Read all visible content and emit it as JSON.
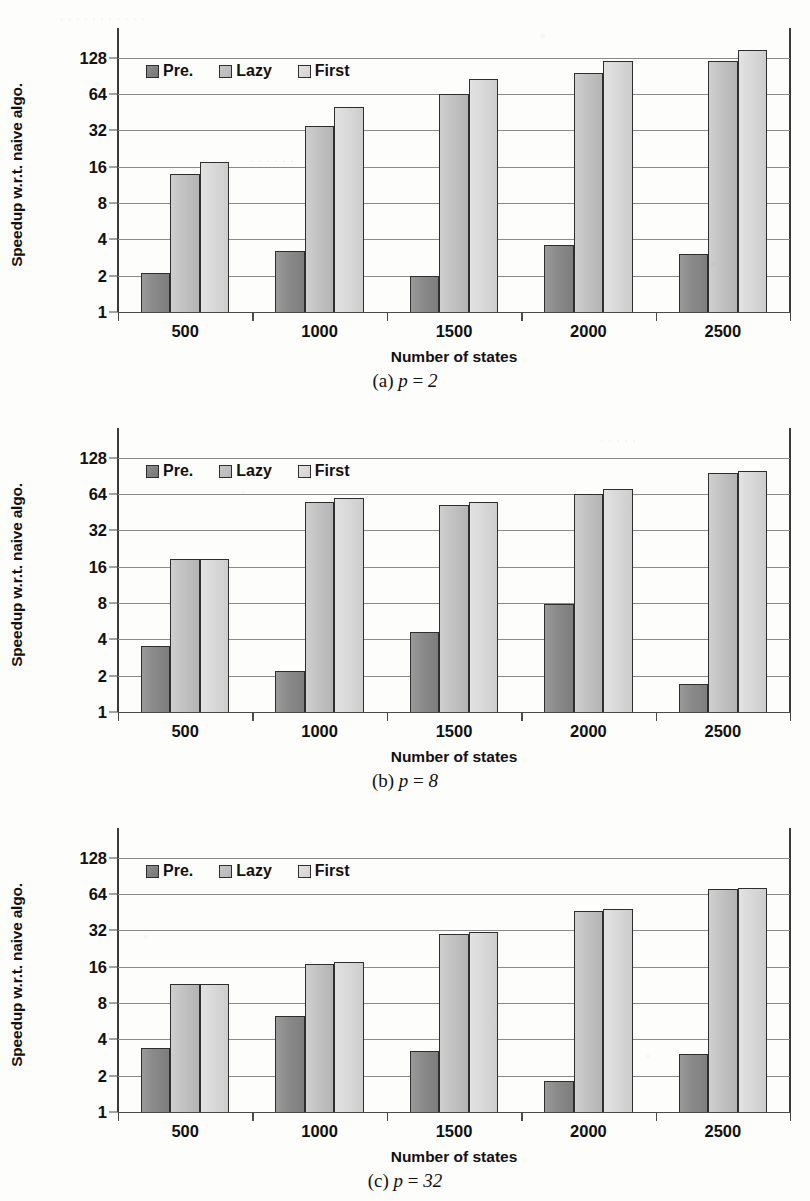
{
  "figure": {
    "axis": {
      "ylabel": "Speedup w.r.t. naive algo.",
      "xlabel": "Number of states",
      "yticks": [
        "1",
        "2",
        "4",
        "8",
        "16",
        "32",
        "64",
        "128"
      ],
      "xticklabels": [
        "500",
        "1000",
        "1500",
        "2000",
        "2500"
      ]
    },
    "legend": {
      "items": [
        {
          "label": "Pre.",
          "swatch": "dark-gray-square-icon",
          "color": "#8b8b8b"
        },
        {
          "label": "Lazy",
          "swatch": "medium-gray-square-icon",
          "color": "#c2c2c2"
        },
        {
          "label": "First",
          "swatch": "light-gray-square-icon",
          "color": "#d9d9d9"
        }
      ]
    },
    "panels": [
      {
        "id": "panel-a",
        "caption_index": "(a)",
        "caption_var": "p",
        "caption_eq": "=",
        "caption_value": "2"
      },
      {
        "id": "panel-b",
        "caption_index": "(b)",
        "caption_var": "p",
        "caption_eq": "=",
        "caption_value": "8"
      },
      {
        "id": "panel-c",
        "caption_index": "(c)",
        "caption_var": "p",
        "caption_eq": "=",
        "caption_value": "32"
      }
    ]
  },
  "chart_data": [
    {
      "type": "bar",
      "title": "(a) p = 2",
      "xlabel": "Number of states",
      "ylabel": "Speedup w.r.t. naive algo.",
      "yscale": "log2",
      "ylim": [
        1,
        180
      ],
      "yticks": [
        1,
        2,
        4,
        8,
        16,
        32,
        64,
        128
      ],
      "grid": true,
      "legend_position": "top-left inside",
      "categories": [
        "500",
        "1000",
        "1500",
        "2000",
        "2500"
      ],
      "series": [
        {
          "name": "Pre.",
          "values": [
            2.1,
            3.2,
            2.0,
            3.6,
            3.0
          ]
        },
        {
          "name": "Lazy",
          "values": [
            14.0,
            35.0,
            64.0,
            95.0,
            120.0
          ]
        },
        {
          "name": "First",
          "values": [
            17.5,
            50.0,
            85.0,
            120.0,
            150.0
          ]
        }
      ]
    },
    {
      "type": "bar",
      "title": "(b) p = 8",
      "xlabel": "Number of states",
      "ylabel": "Speedup w.r.t. naive algo.",
      "yscale": "log2",
      "ylim": [
        1,
        180
      ],
      "yticks": [
        1,
        2,
        4,
        8,
        16,
        32,
        64,
        128
      ],
      "grid": true,
      "legend_position": "top-left inside",
      "categories": [
        "500",
        "1000",
        "1500",
        "2000",
        "2500"
      ],
      "series": [
        {
          "name": "Pre.",
          "values": [
            3.5,
            2.2,
            4.6,
            7.9,
            1.7
          ]
        },
        {
          "name": "Lazy",
          "values": [
            18.5,
            55.0,
            52.0,
            64.0,
            95.0
          ]
        },
        {
          "name": "First",
          "values": [
            18.5,
            59.0,
            55.0,
            70.0,
            100.0
          ]
        }
      ]
    },
    {
      "type": "bar",
      "title": "(c) p = 32",
      "xlabel": "Number of states",
      "ylabel": "Speedup w.r.t. naive algo.",
      "yscale": "log2",
      "ylim": [
        1,
        180
      ],
      "yticks": [
        1,
        2,
        4,
        8,
        16,
        32,
        64,
        128
      ],
      "grid": true,
      "legend_position": "top-left inside",
      "categories": [
        "500",
        "1000",
        "1500",
        "2000",
        "2500"
      ],
      "series": [
        {
          "name": "Pre.",
          "values": [
            3.4,
            6.3,
            3.2,
            1.8,
            3.0
          ]
        },
        {
          "name": "Lazy",
          "values": [
            11.5,
            17.0,
            30.0,
            46.0,
            70.0
          ]
        },
        {
          "name": "First",
          "values": [
            11.5,
            17.5,
            31.0,
            48.0,
            72.0
          ]
        }
      ]
    }
  ]
}
